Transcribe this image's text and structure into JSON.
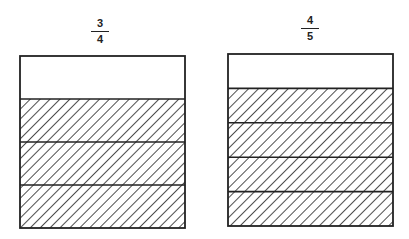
{
  "diagrams": [
    {
      "label": {
        "numerator": "3",
        "denominator": "4"
      },
      "parts": 4,
      "shaded": 3,
      "box": {
        "x": 20,
        "y": 56,
        "w": 165,
        "h": 172
      }
    },
    {
      "label": {
        "numerator": "4",
        "denominator": "5"
      },
      "parts": 5,
      "shaded": 4,
      "box": {
        "x": 228,
        "y": 54,
        "w": 165,
        "h": 172
      }
    }
  ],
  "colors": {
    "stroke": "#222222",
    "background": "#ffffff"
  }
}
